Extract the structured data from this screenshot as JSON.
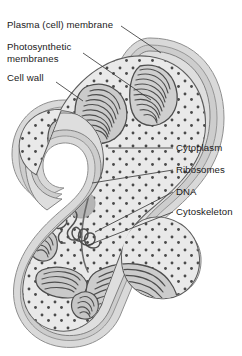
{
  "figure": {
    "background_color": "#ffffff"
  },
  "labels": {
    "plasma_membrane": "Plasma (cell) membrane",
    "photosynthetic_membranes_line1": "Photosynthetic",
    "photosynthetic_membranes_line2": "membranes",
    "cell_wall": "Cell wall",
    "cytoplasm": "Cytoplasm",
    "ribosomes": "Ribosomes",
    "dna": "DNA",
    "cytoskeleton": "Cytoskeleton"
  },
  "colors": {
    "outline": "#595959",
    "leader_line": "#3c3c3c",
    "text": "#1a1a1a",
    "cell_wall_outer": "#d8d8d8",
    "cell_wall_mid": "#c9c9c9",
    "plasma_membrane": "#8c8c8c",
    "cytoplasm": "#e9e9e9",
    "ribosome_dot": "#4a4a4a",
    "dna_strand": "#4f4f4f",
    "thylakoid_stroke": "#4e4e4e",
    "thylakoid_fill": "#c2c2c2",
    "granule_fill": "#b3b3b3"
  },
  "structures": [
    {
      "name": "cell-wall",
      "description": "Outer layered envelope following the S-shaped cell outline"
    },
    {
      "name": "plasma-membrane",
      "description": "Dark membrane just inside the cell wall"
    },
    {
      "name": "cytoplasm",
      "description": "Light gray interior matrix"
    },
    {
      "name": "ribosomes",
      "description": "Small dark dots scattered through the cytoplasm"
    },
    {
      "name": "dna-nucleoid",
      "description": "Irregular looped strand in the middle of the cell"
    },
    {
      "name": "photosynthetic-membranes",
      "description": "Stacks of parallel curved thylakoid lamellae at both ends and mid-cell"
    },
    {
      "name": "cytoskeleton",
      "description": "Long curved filament running lengthwise through the cytoplasm"
    },
    {
      "name": "storage-granules",
      "description": "Two solid gray rounded blobs in the cytoplasm"
    }
  ]
}
